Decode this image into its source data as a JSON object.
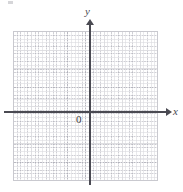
{
  "figure": {
    "width": 183,
    "height": 192,
    "background_color": "#ffffff"
  },
  "axes": {
    "x_axis": {
      "label": "x",
      "color": "#4a4a52",
      "arrow": "right-arrow-icon",
      "y_position_px": 112
    },
    "y_axis": {
      "label": "y",
      "color": "#4a4a52",
      "arrow": "up-arrow-icon",
      "x_position_px": 90
    },
    "origin": {
      "label": "0",
      "color": "#3c3c42"
    }
  },
  "grid": {
    "major_color": "#c9c9cf",
    "minor_color": "#aaaab4",
    "major_cell_px": 18,
    "minor_divisions_per_cell": 5,
    "columns": 8,
    "rows": 8,
    "left_px": 13,
    "top_px": 31,
    "width_px": 145,
    "height_px": 150,
    "style": "dotted-minor-solid-major"
  },
  "chart_data": {
    "type": "scatter",
    "title": "",
    "subtitle": "",
    "xlabel": "x",
    "ylabel": "y",
    "xlim": [
      -4.25,
      3.75
    ],
    "ylim": [
      -3.7,
      4.3
    ],
    "x": [],
    "y": [],
    "series": [],
    "annotations": [
      "0"
    ],
    "grid": true,
    "legend": "none",
    "origin_label": "0",
    "x_ticks": [],
    "y_ticks": []
  }
}
